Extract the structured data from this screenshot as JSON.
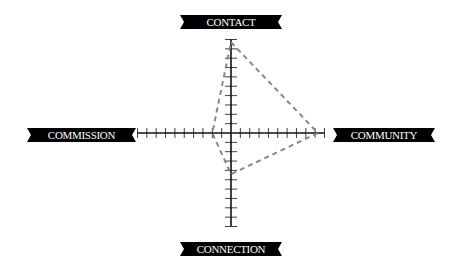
{
  "chart_data": {
    "type": "radar",
    "title": "",
    "axes": [
      {
        "name": "CONTACT",
        "position": "top",
        "max": 10,
        "value": 9.7
      },
      {
        "name": "COMMUNITY",
        "position": "right",
        "max": 10,
        "value": 9.3
      },
      {
        "name": "CONNECTION",
        "position": "bottom",
        "max": 10,
        "value": 4.4
      },
      {
        "name": "COMMISSION",
        "position": "left",
        "max": 10,
        "value": 2
      }
    ],
    "ticks_per_axis": 10,
    "series": [
      {
        "name": "profile",
        "style": "dashed",
        "color": "#888888",
        "values": [
          9.7,
          9.3,
          4.4,
          2
        ]
      }
    ],
    "grid": false,
    "legend": "none"
  },
  "labels": {
    "top": "CONTACT",
    "right": "COMMUNITY",
    "bottom": "CONNECTION",
    "left": "COMMISSION"
  },
  "colors": {
    "axis": "#111111",
    "banner": "#000000",
    "banner_text": "#ffffff",
    "polygon": "#888888"
  }
}
